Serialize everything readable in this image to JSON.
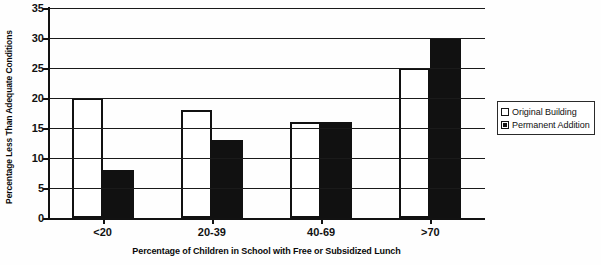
{
  "chart_data": {
    "type": "bar",
    "title": "",
    "subtitle": "",
    "categories": [
      "<20",
      "20-39",
      "40-69",
      ">70"
    ],
    "series": [
      {
        "name": "Original Building",
        "values": [
          20,
          18,
          16,
          25
        ],
        "color": "#ffffff"
      },
      {
        "name": "Permanent Addition",
        "values": [
          8,
          13,
          16,
          30
        ],
        "color": "#111111"
      }
    ],
    "xlabel": "Percentage of Children in School with Free or Subsidized Lunch",
    "ylabel": "Percentage Less Than Adequate Conditions",
    "ylim": [
      0,
      35
    ],
    "ytick_step": 5,
    "yticks": [
      0,
      5,
      10,
      15,
      20,
      25,
      30,
      35
    ],
    "grid": true,
    "legend_position": "right"
  },
  "legend": {
    "entries": [
      {
        "label": "Original Building",
        "swatch": "hollow-square-icon"
      },
      {
        "label": "Permanent Addition",
        "swatch": "filled-square-icon"
      }
    ]
  }
}
